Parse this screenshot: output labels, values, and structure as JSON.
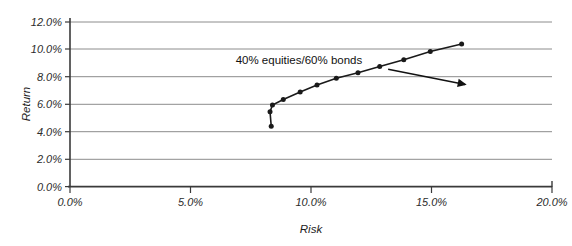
{
  "chart_data": {
    "type": "line",
    "title": "",
    "xlabel": "Risk",
    "ylabel": "Return",
    "xlim": [
      0.0,
      20.0
    ],
    "ylim": [
      0.0,
      12.0
    ],
    "x_tick_labels": [
      "0.0%",
      "5.0%",
      "10.0%",
      "15.0%",
      "20.0%"
    ],
    "x_tick_values": [
      0.0,
      5.0,
      10.0,
      15.0,
      20.0
    ],
    "y_tick_labels": [
      "0.0%",
      "2.0%",
      "4.0%",
      "6.0%",
      "8.0%",
      "10.0%",
      "12.0%"
    ],
    "y_tick_values": [
      0.0,
      2.0,
      4.0,
      6.0,
      8.0,
      10.0,
      12.0
    ],
    "grid": "horizontal",
    "legend": "none",
    "marker": "filled-circle",
    "line_color": "#1a1a1a",
    "grid_color": "#8c8c8c",
    "axis_color": "#3a3a3a",
    "series": [
      {
        "name": "Efficient frontier",
        "x": [
          8.35,
          8.3,
          8.4,
          8.85,
          9.55,
          10.25,
          11.05,
          11.95,
          12.85,
          13.85,
          14.95,
          16.25
        ],
        "y": [
          4.4,
          5.45,
          5.95,
          6.35,
          6.9,
          7.4,
          7.9,
          8.3,
          8.75,
          9.25,
          9.85,
          10.4
        ]
      }
    ],
    "annotations": [
      {
        "text": "40% equities/60% bonds",
        "text_x": 9.5,
        "text_y": 8.95,
        "arrow_from_x": 13.2,
        "arrow_from_y": 8.55,
        "arrow_to_x": 16.4,
        "arrow_to_y": 7.45,
        "points_to_x": 9.55,
        "points_to_y": 6.9
      }
    ]
  }
}
